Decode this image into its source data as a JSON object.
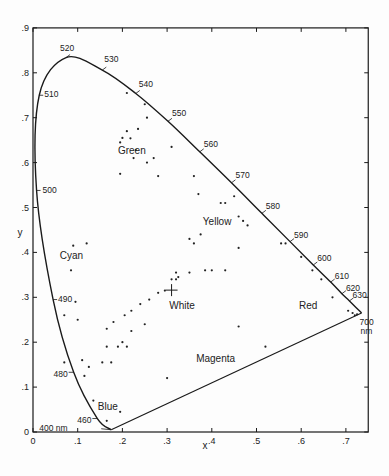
{
  "chart_data": {
    "type": "scatter",
    "title": "",
    "xlabel": "x",
    "ylabel": "y",
    "xlim": [
      0,
      0.75
    ],
    "ylim": [
      0,
      0.9
    ],
    "grid": false,
    "x_ticks": [
      {
        "value": 0,
        "label": "0"
      },
      {
        "value": 0.1,
        "label": ".1"
      },
      {
        "value": 0.2,
        "label": ".2"
      },
      {
        "value": 0.3,
        "label": ".3"
      },
      {
        "value": 0.4,
        "label": ".4"
      },
      {
        "value": 0.5,
        "label": ".5"
      },
      {
        "value": 0.6,
        "label": ".6"
      },
      {
        "value": 0.7,
        "label": ".7"
      }
    ],
    "y_ticks": [
      {
        "value": 0,
        "label": "0"
      },
      {
        "value": 0.1,
        "label": ".1"
      },
      {
        "value": 0.2,
        "label": ".2"
      },
      {
        "value": 0.3,
        "label": ".3"
      },
      {
        "value": 0.4,
        "label": ".4"
      },
      {
        "value": 0.5,
        "label": ".5"
      },
      {
        "value": 0.6,
        "label": ".6"
      },
      {
        "value": 0.7,
        "label": ".7"
      },
      {
        "value": 0.8,
        "label": ".8"
      },
      {
        "value": 0.9,
        "label": ".9"
      }
    ],
    "spectral_locus": [
      {
        "nm": 400,
        "x": 0.175,
        "y": 0.005,
        "label": "400 nm"
      },
      {
        "nm": 460,
        "x": 0.144,
        "y": 0.03,
        "label": "460"
      },
      {
        "nm": 480,
        "x": 0.091,
        "y": 0.133,
        "label": "480"
      },
      {
        "nm": 490,
        "x": 0.045,
        "y": 0.295,
        "label": "490"
      },
      {
        "nm": 500,
        "x": 0.008,
        "y": 0.538,
        "label": "500"
      },
      {
        "nm": 510,
        "x": 0.014,
        "y": 0.75,
        "label": "510"
      },
      {
        "nm": 520,
        "x": 0.074,
        "y": 0.834,
        "label": "520"
      },
      {
        "nm": 530,
        "x": 0.155,
        "y": 0.806,
        "label": "530"
      },
      {
        "nm": 540,
        "x": 0.23,
        "y": 0.754,
        "label": "540"
      },
      {
        "nm": 550,
        "x": 0.302,
        "y": 0.692,
        "label": "550"
      },
      {
        "nm": 560,
        "x": 0.373,
        "y": 0.624,
        "label": "560"
      },
      {
        "nm": 570,
        "x": 0.444,
        "y": 0.555,
        "label": "570"
      },
      {
        "nm": 580,
        "x": 0.512,
        "y": 0.487,
        "label": "580"
      },
      {
        "nm": 590,
        "x": 0.575,
        "y": 0.424,
        "label": "590"
      },
      {
        "nm": 600,
        "x": 0.627,
        "y": 0.372,
        "label": "600"
      },
      {
        "nm": 610,
        "x": 0.666,
        "y": 0.334,
        "label": "610"
      },
      {
        "nm": 620,
        "x": 0.691,
        "y": 0.308,
        "label": "620"
      },
      {
        "nm": 630,
        "x": 0.708,
        "y": 0.292,
        "label": "630"
      },
      {
        "nm": 700,
        "x": 0.735,
        "y": 0.265,
        "label": "700 nm"
      }
    ],
    "region_labels": [
      {
        "text": "Green",
        "x": 0.19,
        "y": 0.62
      },
      {
        "text": "Yellow",
        "x": 0.38,
        "y": 0.46
      },
      {
        "text": "Cyan",
        "x": 0.06,
        "y": 0.385
      },
      {
        "text": "White",
        "x": 0.305,
        "y": 0.275
      },
      {
        "text": "Red",
        "x": 0.595,
        "y": 0.275
      },
      {
        "text": "Magenta",
        "x": 0.365,
        "y": 0.155
      },
      {
        "text": "Blue",
        "x": 0.145,
        "y": 0.048
      }
    ],
    "white_point": {
      "x": 0.31,
      "y": 0.316,
      "marker": "+"
    },
    "series": [
      {
        "name": "sample colors",
        "points": [
          [
            0.21,
            0.755
          ],
          [
            0.25,
            0.73
          ],
          [
            0.255,
            0.7
          ],
          [
            0.21,
            0.67
          ],
          [
            0.235,
            0.675
          ],
          [
            0.2,
            0.655
          ],
          [
            0.218,
            0.654
          ],
          [
            0.23,
            0.628
          ],
          [
            0.195,
            0.645
          ],
          [
            0.225,
            0.61
          ],
          [
            0.195,
            0.575
          ],
          [
            0.255,
            0.6
          ],
          [
            0.27,
            0.61
          ],
          [
            0.28,
            0.57
          ],
          [
            0.31,
            0.635
          ],
          [
            0.36,
            0.57
          ],
          [
            0.37,
            0.53
          ],
          [
            0.42,
            0.51
          ],
          [
            0.43,
            0.51
          ],
          [
            0.45,
            0.525
          ],
          [
            0.46,
            0.48
          ],
          [
            0.47,
            0.47
          ],
          [
            0.48,
            0.46
          ],
          [
            0.375,
            0.44
          ],
          [
            0.36,
            0.42
          ],
          [
            0.35,
            0.43
          ],
          [
            0.555,
            0.42
          ],
          [
            0.565,
            0.42
          ],
          [
            0.6,
            0.39
          ],
          [
            0.625,
            0.36
          ],
          [
            0.645,
            0.34
          ],
          [
            0.67,
            0.3
          ],
          [
            0.705,
            0.27
          ],
          [
            0.715,
            0.265
          ],
          [
            0.72,
            0.26
          ],
          [
            0.725,
            0.262
          ],
          [
            0.46,
            0.41
          ],
          [
            0.43,
            0.36
          ],
          [
            0.4,
            0.36
          ],
          [
            0.385,
            0.36
          ],
          [
            0.35,
            0.355
          ],
          [
            0.32,
            0.355
          ],
          [
            0.325,
            0.345
          ],
          [
            0.31,
            0.34
          ],
          [
            0.32,
            0.34
          ],
          [
            0.295,
            0.315
          ],
          [
            0.28,
            0.31
          ],
          [
            0.26,
            0.295
          ],
          [
            0.24,
            0.285
          ],
          [
            0.22,
            0.27
          ],
          [
            0.205,
            0.26
          ],
          [
            0.18,
            0.245
          ],
          [
            0.165,
            0.23
          ],
          [
            0.165,
            0.19
          ],
          [
            0.19,
            0.19
          ],
          [
            0.21,
            0.19
          ],
          [
            0.155,
            0.155
          ],
          [
            0.125,
            0.145
          ],
          [
            0.175,
            0.155
          ],
          [
            0.09,
            0.415
          ],
          [
            0.12,
            0.42
          ],
          [
            0.085,
            0.36
          ],
          [
            0.095,
            0.29
          ],
          [
            0.07,
            0.26
          ],
          [
            0.1,
            0.25
          ],
          [
            0.07,
            0.155
          ],
          [
            0.11,
            0.16
          ],
          [
            0.115,
            0.125
          ],
          [
            0.135,
            0.07
          ],
          [
            0.165,
            0.025
          ],
          [
            0.195,
            0.045
          ],
          [
            0.3,
            0.12
          ],
          [
            0.46,
            0.235
          ],
          [
            0.52,
            0.19
          ],
          [
            0.22,
            0.225
          ],
          [
            0.25,
            0.24
          ],
          [
            0.2,
            0.2
          ]
        ]
      }
    ]
  }
}
